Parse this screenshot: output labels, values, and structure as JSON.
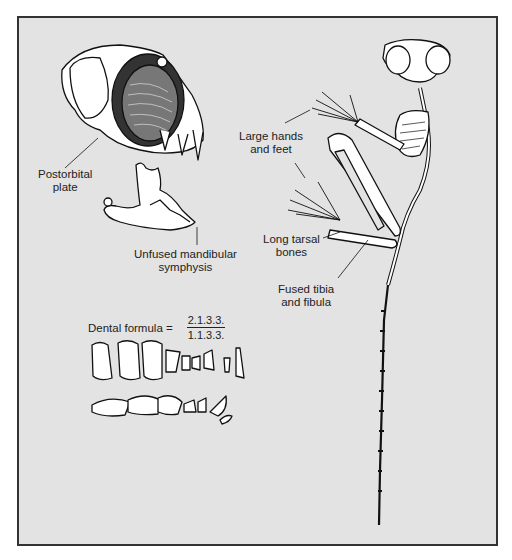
{
  "figure": {
    "labels": {
      "postorbital_plate": [
        "Postorbital",
        "plate"
      ],
      "unfused_symphysis": [
        "Unfused mandibular",
        "symphysis"
      ],
      "large_hands_feet": [
        "Large hands",
        "and feet"
      ],
      "long_tarsal": [
        "Long tarsal",
        "bones"
      ],
      "fused_tibia": [
        "Fused tibia",
        "and fibula"
      ]
    },
    "dental_formula": {
      "label": "Dental formula =",
      "upper": "2.1.3.3.",
      "lower": "1.1.3.3."
    },
    "colors": {
      "background": "#e3e3e3",
      "border": "#333333",
      "bone": "#ffffff",
      "ink": "#111111"
    }
  }
}
